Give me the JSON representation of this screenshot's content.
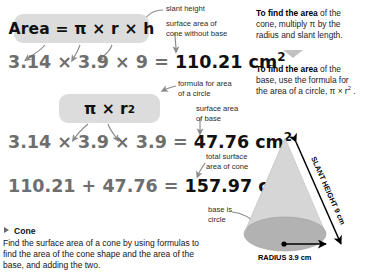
{
  "formulas": {
    "lateral_label": "Area = π × r × h",
    "base_label": "π × r",
    "base_exponent": "2"
  },
  "equations": {
    "lateral": {
      "left": "3.14 × 3.9 × 9 = ",
      "result": "110.21 cm",
      "result_exponent": "2"
    },
    "base": {
      "left": "3.14 × 3.9 × 3.9 = ",
      "result": "47.76 cm",
      "result_exponent": "2"
    },
    "total": {
      "left": "110.21 + 47.76 = ",
      "result": "157.97 cm",
      "result_exponent": "2"
    }
  },
  "annotations": {
    "slant_height": "slant height",
    "lateral_area": "surface area of\ncone without base",
    "circle_formula": "formula for area\nof a circle",
    "base_area": "surface area\nof base",
    "total_area": "total surface\narea of cone",
    "base_is_circle": "base is\ncircle"
  },
  "right_column": {
    "para1_bold": "To find the area",
    "para1_rest": " of the cone, multiply π by the radius and slant length.",
    "para2_bold": "To find the area",
    "para2_rest": " of the base, use the formula for the area of a circle, π × r",
    "para2_exponent": "2",
    "para2_end": " ."
  },
  "section": {
    "title": "Cone",
    "body": "Find the surface area of a cone by using formulas to find the area of the cone shape and the area of the base, and adding the two."
  },
  "diagram": {
    "slant_label": "SLANT HEIGHT 9 cm",
    "radius_label": "RADIUS 3.9 cm"
  },
  "colors": {
    "formula_box_bg": "#dcdcdc",
    "equation_gray": "#6e6e6e",
    "result_black": "#111111",
    "cone_body": "#d6d6d6",
    "cone_base": "#b2b2b2",
    "arrow_gray": "#8a8a8a",
    "triangle_gray": "#c2c2c2"
  }
}
